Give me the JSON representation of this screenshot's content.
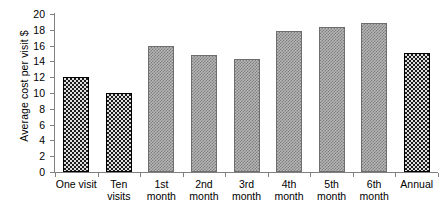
{
  "chart_data": {
    "type": "bar",
    "title": "",
    "xlabel": "",
    "ylabel": "Average cost per visit $",
    "ylim": [
      0,
      20
    ],
    "ytick_step": 2,
    "yticks": [
      20,
      18,
      16,
      14,
      12,
      10,
      8,
      6,
      4,
      2,
      0
    ],
    "grid": false,
    "legend": "none",
    "categories": [
      "One visit",
      "Ten visits",
      "1st month",
      "2nd month",
      "3rd month",
      "4th month",
      "5th month",
      "6th month",
      "Annual"
    ],
    "category_lines": [
      [
        "One visit"
      ],
      [
        "Ten visits"
      ],
      [
        "1st",
        "month"
      ],
      [
        "2nd",
        "month"
      ],
      [
        "3rd",
        "month"
      ],
      [
        "4th",
        "month"
      ],
      [
        "5th",
        "month"
      ],
      [
        "6th",
        "month"
      ],
      [
        "Annual"
      ]
    ],
    "values": [
      12.0,
      10.0,
      16.0,
      14.8,
      14.3,
      17.8,
      18.4,
      18.9,
      15.1
    ],
    "bar_styles": [
      "dark",
      "dark",
      "gray",
      "gray",
      "gray",
      "gray",
      "gray",
      "gray",
      "dark"
    ],
    "colors": {
      "dark_fill": "#1c1c1c",
      "gray_fill": "#b6b6b6",
      "axis": "#808080",
      "text": "#000000",
      "background": "#ffffff"
    }
  }
}
